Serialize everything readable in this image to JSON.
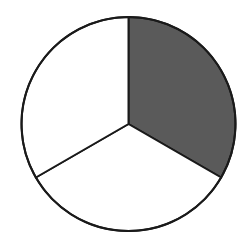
{
  "chart_data": {
    "type": "pie",
    "title": "",
    "categories": [
      "Shaded",
      "Lower",
      "Left"
    ],
    "values": [
      0.3333,
      0.3333,
      0.3333
    ],
    "fractions": [
      "1/3",
      "1/3",
      "1/3"
    ],
    "start_angle_deg": 0,
    "direction": "clockwise from 12 o'clock",
    "legend": "none",
    "labels_visible": false
  },
  "style": {
    "center": [
      128.5,
      124
    ],
    "radius": 107,
    "stroke_color": "#1a1a1a",
    "stroke_width": 2,
    "slice_fills": [
      "#5a5a5a",
      "#ffffff",
      "#ffffff"
    ]
  }
}
